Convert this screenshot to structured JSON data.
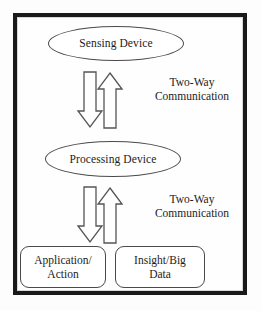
{
  "diagram": {
    "background_color": "#fdfdfd",
    "frame_color": "#1a1a1a",
    "shape_stroke_color": "#4a4a4a",
    "text_color": "#1c1c1c",
    "nodes": [
      {
        "id": "sensing-device",
        "shape": "ellipse",
        "label": "Sensing Device"
      },
      {
        "id": "processing-device",
        "shape": "ellipse",
        "label": "Processing Device"
      },
      {
        "id": "application-action",
        "shape": "rounded-rect",
        "label_line_1": "Application/",
        "label_line_2": "Action"
      },
      {
        "id": "insight-big-data",
        "shape": "rounded-rect",
        "label_line_1": "Insight/Big",
        "label_line_2": "Data"
      }
    ],
    "connectors": [
      {
        "id": "link-sensing-processing",
        "type": "two-way-block-arrows",
        "directions": [
          "down",
          "up"
        ],
        "label_line_1": "Two-Way",
        "label_line_2": "Communication"
      },
      {
        "id": "link-processing-outputs",
        "type": "two-way-block-arrows",
        "directions": [
          "down",
          "up"
        ],
        "label_line_1": "Two-Way",
        "label_line_2": "Communication"
      }
    ]
  }
}
